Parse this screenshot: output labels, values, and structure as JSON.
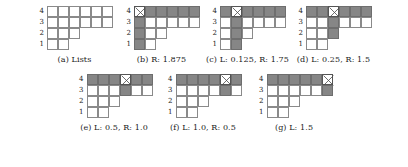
{
  "figure": {
    "row_axis_labels": [
      "4",
      "3",
      "2",
      "1"
    ],
    "shade_color": "#868686",
    "line_color": "#8a8a8a",
    "marker_icon": "x-cross-icon",
    "panels": [
      {
        "id": "a",
        "caption": "(a) Lists",
        "show_axis": true,
        "row_lengths": [
          6,
          6,
          3,
          2
        ],
        "shaded": [],
        "marked": null
      },
      {
        "id": "b",
        "caption": "(b) R: 1.875",
        "show_axis": true,
        "row_lengths": [
          6,
          6,
          3,
          2
        ],
        "shaded": [
          [
            4,
            2
          ],
          [
            4,
            3
          ],
          [
            4,
            4
          ],
          [
            4,
            5
          ],
          [
            4,
            6
          ],
          [
            3,
            1
          ],
          [
            2,
            1
          ],
          [
            1,
            1
          ]
        ],
        "marked": [
          4,
          1
        ]
      },
      {
        "id": "c",
        "caption": "(c) L: 0.125, R: 1.75",
        "show_axis": true,
        "row_lengths": [
          6,
          6,
          3,
          2
        ],
        "shaded": [
          [
            4,
            1
          ],
          [
            4,
            3
          ],
          [
            4,
            4
          ],
          [
            4,
            5
          ],
          [
            4,
            6
          ],
          [
            3,
            2
          ],
          [
            2,
            2
          ],
          [
            1,
            2
          ]
        ],
        "marked": [
          4,
          2
        ]
      },
      {
        "id": "d",
        "caption": "(d) L: 0.25, R: 1.5",
        "show_axis": true,
        "row_lengths": [
          6,
          6,
          3,
          2
        ],
        "shaded": [
          [
            4,
            1
          ],
          [
            4,
            2
          ],
          [
            4,
            4
          ],
          [
            4,
            5
          ],
          [
            4,
            6
          ],
          [
            3,
            3
          ],
          [
            2,
            3
          ]
        ],
        "marked": [
          4,
          3
        ]
      },
      {
        "id": "e",
        "caption": "(e) L: 0.5, R: 1.0",
        "show_axis": true,
        "row_lengths": [
          6,
          6,
          3,
          2
        ],
        "shaded": [
          [
            4,
            1
          ],
          [
            4,
            2
          ],
          [
            4,
            3
          ],
          [
            4,
            5
          ],
          [
            4,
            6
          ],
          [
            3,
            4
          ]
        ],
        "marked": [
          4,
          4
        ]
      },
      {
        "id": "f",
        "caption": "(f) L: 1.0, R: 0.5",
        "show_axis": true,
        "row_lengths": [
          6,
          6,
          3,
          2
        ],
        "shaded": [
          [
            4,
            1
          ],
          [
            4,
            2
          ],
          [
            4,
            3
          ],
          [
            4,
            4
          ],
          [
            4,
            6
          ],
          [
            3,
            5
          ]
        ],
        "marked": [
          4,
          5
        ]
      },
      {
        "id": "g",
        "caption": "(g) L: 1.5",
        "show_axis": true,
        "row_lengths": [
          6,
          6,
          3,
          2
        ],
        "shaded": [
          [
            4,
            1
          ],
          [
            4,
            2
          ],
          [
            4,
            3
          ],
          [
            4,
            4
          ],
          [
            4,
            5
          ],
          [
            3,
            6
          ]
        ],
        "marked": [
          4,
          6
        ]
      }
    ]
  }
}
